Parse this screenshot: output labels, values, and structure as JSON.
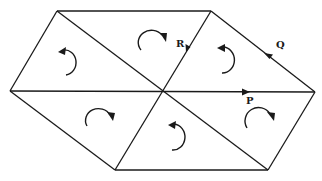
{
  "diagram": {
    "vertices": {
      "left": [
        10,
        91
      ],
      "top_left": [
        57,
        11
      ],
      "top_right": [
        211,
        11
      ],
      "right": [
        315,
        92
      ],
      "bottom_right": [
        268,
        170
      ],
      "bottom_left": [
        115,
        170
      ],
      "center": [
        162,
        92
      ]
    },
    "triangles": [
      {
        "id": "upper-left-triangle",
        "circulation": "counterclockwise"
      },
      {
        "id": "upper-middle-triangle",
        "circulation": "clockwise"
      },
      {
        "id": "upper-right-triangle",
        "circulation": "counterclockwise"
      },
      {
        "id": "lower-left-triangle",
        "circulation": "clockwise"
      },
      {
        "id": "lower-middle-triangle",
        "circulation": "counterclockwise"
      },
      {
        "id": "lower-right-triangle",
        "circulation": "clockwise"
      }
    ],
    "vectors": [
      {
        "label": "R",
        "edge": "top_right to center",
        "direction": "down-left"
      },
      {
        "label": "Q",
        "edge": "right to top_right",
        "direction": "up-left"
      },
      {
        "label": "P",
        "edge": "center to right",
        "direction": "right"
      }
    ]
  },
  "labels": {
    "r": "R",
    "q": "Q",
    "p": "P"
  }
}
